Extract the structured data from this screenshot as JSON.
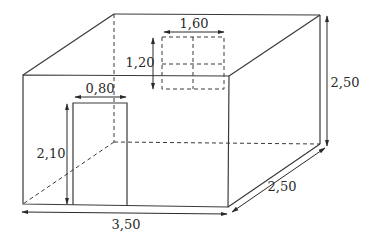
{
  "diagram": {
    "dimensions": {
      "length_label": "3,50",
      "depth_label": "2,50",
      "height_label": "2,50",
      "door_width_label": "0,80",
      "door_height_label": "2,10",
      "window_width_label": "1,60",
      "window_height_label": "1,20"
    },
    "colors": {
      "line": "#3a3a3a",
      "background": "#ffffff"
    }
  }
}
